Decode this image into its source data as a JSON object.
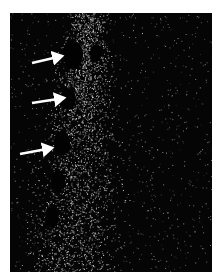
{
  "figure": {
    "background_color": "#050505",
    "speckle_color": "#e8e8e8",
    "arrow_color": "#ffffff",
    "arrows": [
      {
        "label": "arrow-1",
        "x1": 22,
        "y1": 50,
        "x2": 52,
        "y2": 43
      },
      {
        "label": "arrow-2",
        "x1": 22,
        "y1": 90,
        "x2": 54,
        "y2": 85
      },
      {
        "label": "arrow-3",
        "x1": 10,
        "y1": 141,
        "x2": 42,
        "y2": 135
      }
    ],
    "holes": [
      {
        "cx": 63,
        "cy": 42,
        "rx": 10,
        "ry": 14
      },
      {
        "cx": 86,
        "cy": 40,
        "rx": 6,
        "ry": 9
      },
      {
        "cx": 58,
        "cy": 86,
        "rx": 8,
        "ry": 11
      },
      {
        "cx": 52,
        "cy": 130,
        "rx": 8,
        "ry": 12
      },
      {
        "cx": 48,
        "cy": 168,
        "rx": 7,
        "ry": 11
      },
      {
        "cx": 42,
        "cy": 205,
        "rx": 7,
        "ry": 10
      }
    ]
  }
}
